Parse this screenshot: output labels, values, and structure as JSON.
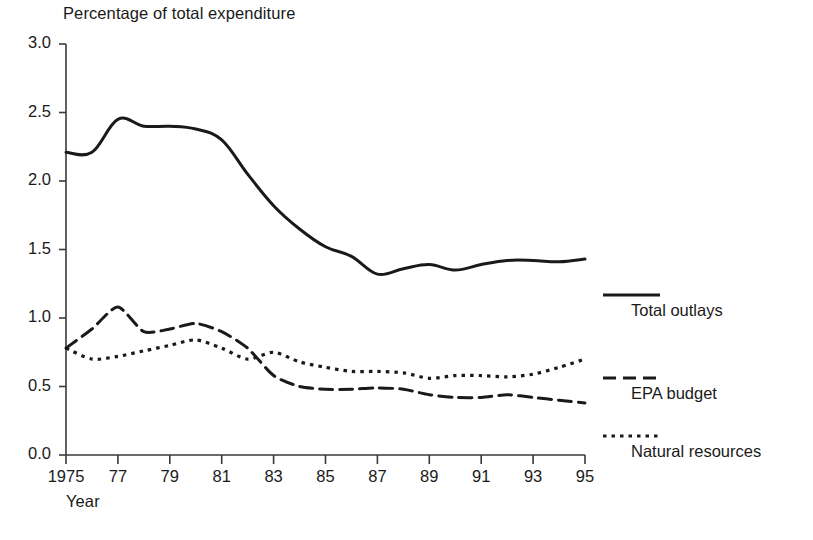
{
  "chart_data": {
    "type": "line",
    "title": "Percentage of total expenditure",
    "xlabel": "Year",
    "ylabel": "",
    "xlim": [
      1975,
      1995
    ],
    "ylim": [
      0.0,
      3.0
    ],
    "grid": false,
    "legend_position": "right",
    "ytick_labels": [
      "3.0",
      "2.5",
      "2.0",
      "1.5",
      "1.0",
      "0.5",
      "0.0"
    ],
    "ytick_values": [
      3.0,
      2.5,
      2.0,
      1.5,
      1.0,
      0.5,
      0.0
    ],
    "xtick_labels": [
      "1975",
      "77",
      "79",
      "81",
      "83",
      "85",
      "87",
      "89",
      "91",
      "93",
      "95"
    ],
    "xtick_values": [
      1975,
      1977,
      1979,
      1981,
      1983,
      1985,
      1987,
      1989,
      1991,
      1993,
      1995
    ],
    "x": [
      1975,
      1976,
      1977,
      1978,
      1979,
      1980,
      1981,
      1982,
      1983,
      1984,
      1985,
      1986,
      1987,
      1988,
      1989,
      1990,
      1991,
      1992,
      1993,
      1994,
      1995
    ],
    "series": [
      {
        "name": "Total outlays",
        "style": "solid",
        "color": "#1a1a1a",
        "values": [
          2.21,
          2.21,
          2.45,
          2.4,
          2.4,
          2.38,
          2.3,
          2.05,
          1.82,
          1.65,
          1.52,
          1.45,
          1.32,
          1.36,
          1.39,
          1.35,
          1.39,
          1.42,
          1.42,
          1.41,
          1.43
        ]
      },
      {
        "name": "EPA budget",
        "style": "dashed",
        "color": "#1a1a1a",
        "values": [
          0.78,
          0.92,
          1.08,
          0.9,
          0.92,
          0.96,
          0.9,
          0.78,
          0.58,
          0.5,
          0.48,
          0.48,
          0.49,
          0.48,
          0.44,
          0.42,
          0.42,
          0.44,
          0.42,
          0.4,
          0.38
        ]
      },
      {
        "name": "Natural resources",
        "style": "dotted",
        "color": "#1a1a1a",
        "values": [
          0.78,
          0.7,
          0.72,
          0.76,
          0.8,
          0.84,
          0.78,
          0.7,
          0.75,
          0.68,
          0.64,
          0.61,
          0.61,
          0.6,
          0.56,
          0.58,
          0.58,
          0.57,
          0.59,
          0.64,
          0.7
        ]
      }
    ]
  },
  "legend": [
    {
      "label": "Total outlays",
      "style": "solid"
    },
    {
      "label": "EPA budget",
      "style": "dashed"
    },
    {
      "label": "Natural resources",
      "style": "dotted"
    }
  ]
}
